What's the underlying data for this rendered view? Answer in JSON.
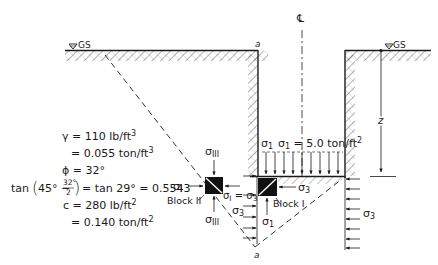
{
  "diagram": {
    "title": "",
    "labels": {
      "centerline": "℄",
      "ground_surface_left": "GS",
      "ground_surface_right": "GS",
      "point_a_top": "a",
      "point_a_bottom": "a",
      "depth": "z",
      "sigma1_top": "σ",
      "sigma1_top_sub": "1",
      "load_eq": "σ",
      "load_eq_sub": "1",
      "load_eq_value": " = 5.0 ton/ft",
      "load_eq_exp": "2",
      "sigma3_block1": "σ",
      "sigma3_block1_sub": "3",
      "block1": "Block I",
      "sigma1_below": "σ",
      "sigma1_below_sub": "1",
      "sigma3_left_wall": "σ",
      "sigma3_left_wall_sub": "3",
      "sigma3_right_wall": "σ",
      "sigma3_right_wall_sub": "3",
      "block2": "Block II",
      "sigmaIII_top": "σ",
      "sigmaIII_top_sub": "III",
      "sigmaIII_bottom": "σ",
      "sigmaIII_bottom_sub": "III",
      "sigmaI_left": "σ",
      "sigmaI_left_sub": "I",
      "sigmaI_eq_sigma3": "σ",
      "sigmaI_eq_sigma3_sub": "I",
      "sigmaI_eq_sigma3_mid": " = σ",
      "sigmaI_eq_sigma3_sub2": "3"
    },
    "properties": [
      {
        "text": "γ = 110 lb/ft³"
      },
      {
        "text": "= 0.055 ton/ft³"
      },
      {
        "text": "ϕ = 32°"
      },
      {
        "text": "tan(45° − 32°/2) = tan 29° = 0.5543"
      },
      {
        "text": "c = 280 lb/ft²"
      },
      {
        "text": "= 0.140 ton/ft²"
      }
    ],
    "props_display": {
      "gamma": "γ = 110 lb/ft",
      "gamma_exp": "3",
      "gamma_ton": "= 0.055 ton/ft",
      "gamma_ton_exp": "3",
      "phi": "ϕ = 32°",
      "tan_prefix": "tan",
      "tan_num": "32°",
      "tan_den": "2",
      "tan_inner": "45° −",
      "tan_rest": "= tan 29° = 0.5543",
      "c": "c = 280 lb/ft",
      "c_exp": "2",
      "c_ton": "= 0.140 ton/ft",
      "c_ton_exp": "2"
    },
    "colors": {
      "ink": "#1a1a1a",
      "hatch": "#555555",
      "background": "#ffffff"
    }
  }
}
